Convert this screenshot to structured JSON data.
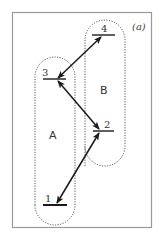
{
  "figure": {
    "panel_label": "(a)",
    "frame_color": "#9a9a9a",
    "ink_color": "#1a1a1a",
    "groups": [
      {
        "id": "A",
        "label": "A",
        "levels": [
          "1",
          "3"
        ]
      },
      {
        "id": "B",
        "label": "B",
        "levels": [
          "2",
          "4"
        ]
      }
    ],
    "levels": [
      {
        "id": "1",
        "label": "1",
        "group": "A"
      },
      {
        "id": "2",
        "label": "2",
        "group": "B"
      },
      {
        "id": "3",
        "label": "3",
        "group": "A"
      },
      {
        "id": "4",
        "label": "4",
        "group": "B"
      }
    ],
    "transitions": [
      {
        "from": "3",
        "to": "4",
        "type": "double-arrow"
      },
      {
        "from": "3",
        "to": "2",
        "type": "double-arrow"
      },
      {
        "from": "1",
        "to": "2",
        "type": "double-arrow"
      }
    ]
  }
}
